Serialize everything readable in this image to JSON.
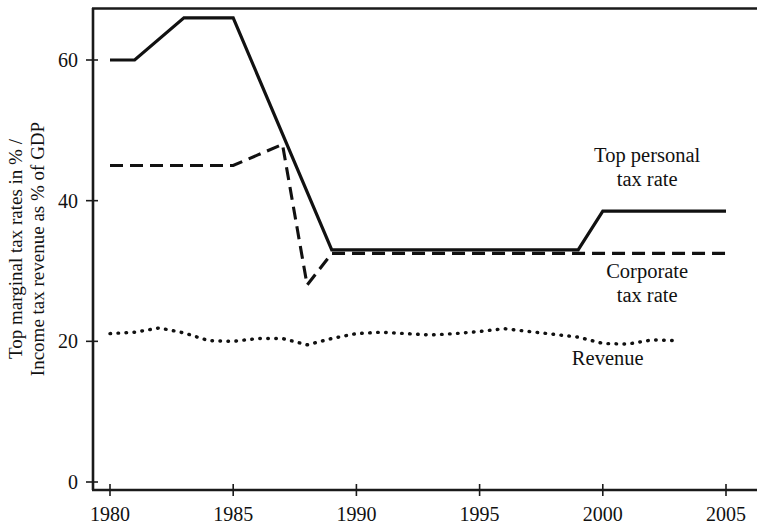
{
  "chart_data": {
    "type": "line",
    "title": "",
    "subtitle": "",
    "xlabel": "",
    "ylabel": "Top marginal tax rates in % / Income tax revenue as % of GDP",
    "ylabel_line1": "Top marginal tax rates in % /",
    "ylabel_line2": "Income tax revenue as % of GDP",
    "xlim": [
      1979.3,
      2005.6
    ],
    "ylim": [
      0,
      68.6
    ],
    "grid": false,
    "legend_position": "inline-right-annotations",
    "y_ticks": [
      0,
      20,
      40,
      60
    ],
    "y_tick_labels": [
      "0",
      "20",
      "40",
      "60"
    ],
    "x_ticks": [
      1980,
      1985,
      1990,
      1995,
      2000,
      2005
    ],
    "x_tick_labels": [
      "1980",
      "1985",
      "1990",
      "1995",
      "2000",
      "2005"
    ],
    "series": [
      {
        "name": "Top personal tax rate",
        "style": "solid",
        "x": [
          1980,
          1981,
          1983,
          1985,
          1989,
          1999,
          2000,
          2005
        ],
        "values": [
          60,
          60,
          66,
          66,
          33,
          33,
          38.5,
          38.5
        ]
      },
      {
        "name": "Corporate tax rate",
        "style": "dashed",
        "x": [
          1980,
          1985,
          1986,
          1987,
          1988,
          1989,
          1999,
          2005
        ],
        "values": [
          45,
          45,
          46.5,
          48,
          28,
          32.5,
          32.5,
          32.5
        ]
      },
      {
        "name": "Revenue",
        "style": "dotted",
        "x": [
          1980,
          1981,
          1982,
          1983,
          1984,
          1985,
          1986,
          1987,
          1988,
          1989,
          1990,
          1991,
          1992,
          1993,
          1994,
          1995,
          1996,
          1997,
          1998,
          1999,
          2000,
          2001,
          2002,
          2003
        ],
        "values": [
          21.1,
          21.3,
          21.9,
          21.2,
          20.1,
          20.0,
          20.4,
          20.4,
          19.5,
          20.4,
          21.1,
          21.3,
          21.1,
          20.9,
          21.1,
          21.4,
          21.8,
          21.4,
          21.0,
          20.6,
          19.7,
          19.6,
          20.2,
          20.1
        ]
      }
    ],
    "annotations": [
      {
        "name": "top-personal-tax-rate-label",
        "line1": "Top personal",
        "line2": "tax rate",
        "x": 2001.8,
        "y": 45.5
      },
      {
        "name": "corporate-tax-rate-label",
        "line1": "Corporate",
        "line2": "tax rate",
        "x": 2001.8,
        "y": 29.0
      },
      {
        "name": "revenue-label",
        "line1": "Revenue",
        "line2": "",
        "x": 2000.2,
        "y": 16.6
      }
    ]
  }
}
